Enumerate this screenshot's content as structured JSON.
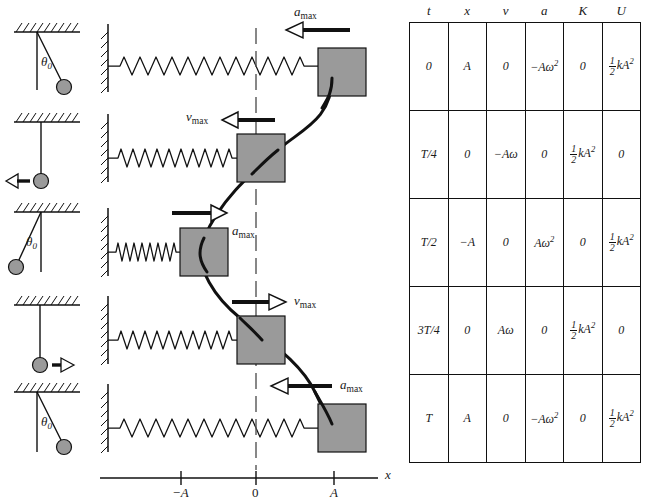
{
  "figure": {
    "kind": "physics-diagram"
  },
  "axis": {
    "label_x": "x",
    "ticks": [
      {
        "label": "−A",
        "value": -1
      },
      {
        "label": "0",
        "value": 0
      },
      {
        "label": "A",
        "value": 1
      }
    ]
  },
  "pendulums": [
    {
      "name": "pendulum-row-1",
      "state": "displaced-right",
      "angle_label": "θ",
      "angle_sub": "0",
      "arrow": "none"
    },
    {
      "name": "pendulum-row-2",
      "state": "vertical",
      "angle_label": "",
      "angle_sub": "",
      "arrow": "left"
    },
    {
      "name": "pendulum-row-3",
      "state": "displaced-left",
      "angle_label": "θ",
      "angle_sub": "0",
      "arrow": "none"
    },
    {
      "name": "pendulum-row-4",
      "state": "vertical",
      "angle_label": "",
      "angle_sub": "",
      "arrow": "right"
    },
    {
      "name": "pendulum-row-5",
      "state": "displaced-right",
      "angle_label": "θ",
      "angle_sub": "0",
      "arrow": "none"
    }
  ],
  "spring_rows": [
    {
      "name": "spring-row-1",
      "block_position": "A",
      "spring": "stretched",
      "arrow_dir": "left",
      "arrow_label": "a",
      "arrow_sub": "max"
    },
    {
      "name": "spring-row-2",
      "block_position": "0",
      "spring": "natural",
      "arrow_dir": "left",
      "arrow_label": "v",
      "arrow_sub": "max"
    },
    {
      "name": "spring-row-3",
      "block_position": "-A",
      "spring": "compressed",
      "arrow_dir": "right",
      "arrow_label": "a",
      "arrow_sub": "max"
    },
    {
      "name": "spring-row-4",
      "block_position": "0",
      "spring": "natural",
      "arrow_dir": "right",
      "arrow_label": "v",
      "arrow_sub": "max"
    },
    {
      "name": "spring-row-5",
      "block_position": "A",
      "spring": "stretched",
      "arrow_dir": "left",
      "arrow_label": "a",
      "arrow_sub": "max"
    }
  ],
  "table": {
    "headers": [
      "t",
      "x",
      "v",
      "a",
      "K",
      "U"
    ],
    "rows": [
      {
        "t": "0",
        "x": "A",
        "v": "0",
        "a": "−Aω²",
        "K": "0",
        "U": "½ kA²"
      },
      {
        "t": "T/4",
        "x": "0",
        "v": "−Aω",
        "a": "0",
        "K": "½ kA²",
        "U": "0"
      },
      {
        "t": "T/2",
        "x": "−A",
        "v": "0",
        "a": "Aω²",
        "K": "0",
        "U": "½ kA²"
      },
      {
        "t": "3T/4",
        "x": "0",
        "v": "Aω",
        "a": "0",
        "K": "½ kA²",
        "U": "0"
      },
      {
        "t": "T",
        "x": "A",
        "v": "0",
        "a": "−Aω²",
        "K": "0",
        "U": "½ kA²"
      }
    ]
  },
  "colors": {
    "block_fill": "#9a9a9a",
    "bob_fill": "#9a9a9a",
    "stroke": "#111111",
    "background": "#ffffff"
  }
}
